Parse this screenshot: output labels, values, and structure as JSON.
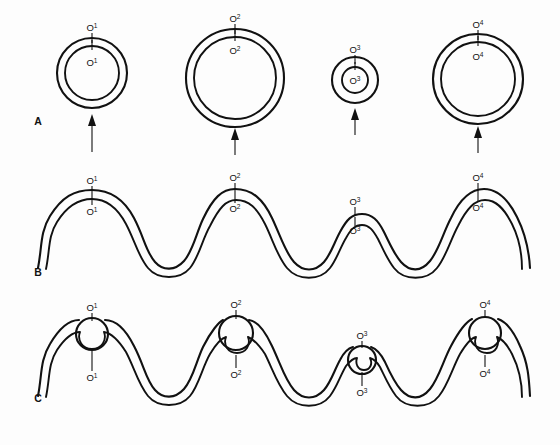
{
  "figure": {
    "background_color": "#fdfdfd",
    "line_color": "#111111"
  },
  "panels": [
    {
      "id": "A",
      "letter": "A",
      "description": "Four circular replicons of differing size, each with an origin marked on the outer and inner strand and an upward arrow below",
      "letter_x": 38,
      "letter_y": 125
    },
    {
      "id": "B",
      "letter": "B",
      "description": "Linear double-stranded chromosome drawn as a wave with four humps, origins labelled at the apex of each hump",
      "letter_x": 38,
      "letter_y": 276
    },
    {
      "id": "C",
      "letter": "C",
      "description": "Same linear chromosome with replication bubbles opened at each origin",
      "letter_x": 38,
      "letter_y": 402
    }
  ],
  "origins": [
    {
      "name": "O1",
      "base": "O",
      "superscript": "1",
      "panelA": {
        "cx": 92,
        "cy": 73,
        "outer_r": 35,
        "inner_r": 27,
        "outer_label_x": 92,
        "outer_label_y": 31,
        "inner_label_x": 92,
        "inner_label_y": 66,
        "arrow_x": 92,
        "arrow_top": 114,
        "arrow_bottom": 152
      },
      "panelB": {
        "apex_x": 92,
        "outer_label_x": 92,
        "outer_label_y": 184,
        "inner_label_x": 92,
        "inner_label_y": 215
      },
      "panelC": {
        "apex_x": 92,
        "bubble_r": 16,
        "outer_label_x": 92,
        "outer_label_y": 311,
        "inner_label_x": 92,
        "inner_label_y": 381
      }
    },
    {
      "name": "O2",
      "base": "O",
      "superscript": "2",
      "panelA": {
        "cx": 235,
        "cy": 78,
        "outer_r": 49,
        "inner_r": 41,
        "outer_label_x": 235,
        "outer_label_y": 22,
        "inner_label_x": 235,
        "inner_label_y": 54,
        "arrow_x": 235,
        "arrow_top": 128,
        "arrow_bottom": 155
      },
      "panelB": {
        "apex_x": 235,
        "outer_label_x": 235,
        "outer_label_y": 181,
        "inner_label_x": 235,
        "inner_label_y": 212
      },
      "panelC": {
        "apex_x": 235,
        "bubble_r": 17,
        "outer_label_x": 235,
        "outer_label_y": 308,
        "inner_label_x": 235,
        "inner_label_y": 378
      }
    },
    {
      "name": "O3",
      "base": "O",
      "superscript": "3",
      "panelA": {
        "cx": 355,
        "cy": 80,
        "outer_r": 23,
        "inner_r": 13,
        "outer_label_x": 355,
        "outer_label_y": 53,
        "inner_label_x": 355,
        "inner_label_y": 84,
        "arrow_x": 355,
        "arrow_top": 108,
        "arrow_bottom": 135
      },
      "panelB": {
        "apex_x": 355,
        "outer_label_x": 355,
        "outer_label_y": 205,
        "inner_label_x": 355,
        "inner_label_y": 234
      },
      "panelC": {
        "apex_x": 355,
        "bubble_r": 14,
        "outer_label_x": 355,
        "outer_label_y": 339,
        "inner_label_x": 355,
        "inner_label_y": 396
      }
    },
    {
      "name": "O4",
      "base": "O",
      "superscript": "4",
      "panelA": {
        "cx": 478,
        "cy": 79,
        "outer_r": 45,
        "inner_r": 37,
        "outer_label_x": 478,
        "outer_label_y": 28,
        "inner_label_x": 478,
        "inner_label_y": 60,
        "arrow_x": 478,
        "arrow_top": 126,
        "arrow_bottom": 153
      },
      "panelB": {
        "apex_x": 478,
        "outer_label_x": 478,
        "outer_label_y": 181,
        "inner_label_x": 478,
        "inner_label_y": 211
      },
      "panelC": {
        "apex_x": 478,
        "bubble_r": 16,
        "outer_label_x": 478,
        "outer_label_y": 308,
        "inner_label_x": 478,
        "inner_label_y": 377
      }
    }
  ],
  "arrows": {
    "count": 4,
    "direction": "up",
    "semantic": "origin-of-replication-pointer"
  },
  "panelB_path": {
    "outer": "M 38 268 C 42 248 40 232 50 216 C 62 197 74 190 92 190 C 110 190 124 199 134 218 C 144 237 146 252 155 262 C 163 271 175 271 184 261 C 193 251 196 234 203 219 C 213 198 222 189 235 189 C 252 189 263 199 272 218 C 281 237 285 252 294 262 C 303 272 315 272 324 262 C 331 254 334 243 340 232 C 347 219 352 214 362 214 C 372 214 378 220 384 232 C 390 244 394 254 401 262 C 410 272 421 272 430 261 C 439 250 443 233 451 218 C 460 199 470 189 484 189 C 498 189 508 199 517 217 C 526 235 529 250 530 268",
    "inner": "M 46 269 C 50 250 48 236 57 222 C 67 206 78 199 92 199 C 106 199 117 207 126 224 C 135 241 138 256 148 268 C 158 280 180 280 190 268 C 199 257 202 240 210 226 C 219 208 226 200 236 200 C 249 200 257 208 265 224 C 273 240 277 256 287 268 C 298 281 320 281 330 268 C 337 259 340 248 346 238 C 351 229 355 225 362 225 C 369 225 373 230 378 239 C 383 249 387 259 394 268 C 404 281 427 281 437 268 C 446 257 450 241 458 226 C 467 208 475 200 485 200 C 496 200 504 208 512 224 C 520 240 522 254 522 269"
  },
  "panelC_path": {
    "outer": "M 38 396 C 42 376 40 360 50 344 C 62 325 72 318 82 320 C 68 330 70 343 78 348 C 86 353 100 353 108 348 C 118 342 118 330 104 320 C 115 318 125 327 134 346 C 144 365 146 380 155 390 C 163 399 175 399 184 389 C 193 379 196 362 203 347 C 211 330 219 321 226 318 C 212 328 214 341 222 346 C 230 351 244 351 252 346 C 262 340 262 328 248 318 C 257 320 265 329 272 346 C 281 365 285 380 294 390 C 303 400 315 400 324 390 C 331 382 334 371 340 360 C 345 350 350 346 356 346 C 345 352 346 362 352 366 C 358 370 368 370 374 366 C 382 361 380 352 369 346 C 376 347 380 352 385 362 C 390 373 394 382 401 390 C 410 400 421 400 430 389 C 439 378 443 361 451 346 C 459 330 467 321 475 319 C 461 329 463 342 471 347 C 479 352 493 352 501 347 C 511 341 511 329 497 319 C 507 321 513 331 520 346 C 528 363 529 378 530 396",
    "inner": "M 46 397 C 50 378 48 364 57 350 C 66 337 74 331 82 331 C 78 339 82 348 92 348 C 102 348 106 339 102 331 C 110 331 118 339 126 352 C 135 369 138 384 148 396 C 158 408 180 408 190 396 C 199 385 202 368 210 354 C 217 343 223 337 228 336 C 224 344 228 352 237 352 C 246 352 250 344 246 336 C 252 338 259 344 265 354 C 273 370 277 384 287 396 C 298 409 320 409 330 396 C 337 387 340 376 346 366 C 350 360 354 357 358 357 C 355 363 358 369 364 369 C 370 369 373 363 370 357 C 374 358 377 361 380 367 C 385 377 389 387 396 396 C 406 409 429 409 439 396 C 448 385 452 369 460 354 C 466 343 472 337 477 336 C 473 344 477 352 486 352 C 495 352 499 344 495 336 C 501 338 507 345 512 354 C 520 370 522 383 522 397"
  }
}
